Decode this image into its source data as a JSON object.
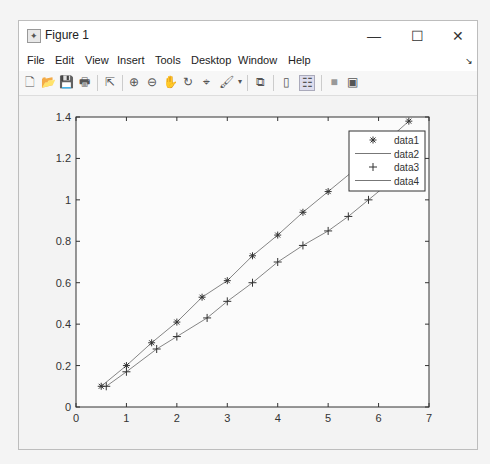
{
  "window": {
    "title": "Figure 1",
    "controls": {
      "minimize": "—",
      "maximize": "☐",
      "close": "✕"
    }
  },
  "menu": [
    "File",
    "Edit",
    "View",
    "Insert",
    "Tools",
    "Desktop",
    "Window",
    "Help"
  ],
  "toolbar": [
    {
      "name": "new-figure-icon",
      "glyph": "🗋"
    },
    {
      "name": "open-file-icon",
      "glyph": "📂"
    },
    {
      "name": "save-icon",
      "glyph": "💾"
    },
    {
      "name": "print-icon",
      "glyph": "🖶"
    },
    {
      "name": "edit-plot-icon",
      "glyph": "⇱"
    },
    {
      "name": "zoom-in-icon",
      "glyph": "⊕"
    },
    {
      "name": "zoom-out-icon",
      "glyph": "⊖"
    },
    {
      "name": "pan-icon",
      "glyph": "✋"
    },
    {
      "name": "rotate-3d-icon",
      "glyph": "↻"
    },
    {
      "name": "data-cursor-icon",
      "glyph": "⌖"
    },
    {
      "name": "brush-icon",
      "glyph": "🖌"
    },
    {
      "name": "link-plot-icon",
      "glyph": "⧉"
    },
    {
      "name": "colorbar-icon",
      "glyph": "▯"
    },
    {
      "name": "legend-icon",
      "glyph": "☷"
    },
    {
      "name": "hide-plot-tools-icon",
      "glyph": "■"
    },
    {
      "name": "show-plot-tools-icon",
      "glyph": "▣"
    }
  ],
  "chart_data": {
    "type": "line",
    "title": "",
    "xlabel": "",
    "ylabel": "",
    "xlim": [
      0,
      7
    ],
    "ylim": [
      0,
      1.4
    ],
    "xticks": [
      "0",
      "1",
      "2",
      "3",
      "4",
      "5",
      "6",
      "7"
    ],
    "yticks": [
      "0",
      "0.2",
      "0.4",
      "0.6",
      "0.8",
      "1",
      "1.2",
      "1.4"
    ],
    "grid": false,
    "legend_position": "northeast",
    "legend": [
      "data1",
      "data2",
      "data3",
      "data4"
    ],
    "series": [
      {
        "name": "data1",
        "marker": "*",
        "line": "none",
        "x": [
          0.5,
          1.0,
          1.5,
          2.0,
          2.5,
          3.0,
          3.5,
          4.0,
          4.5,
          5.0,
          5.5,
          6.0,
          6.6
        ],
        "y": [
          0.1,
          0.2,
          0.31,
          0.41,
          0.53,
          0.61,
          0.73,
          0.83,
          0.94,
          1.04,
          1.14,
          1.25,
          1.38
        ]
      },
      {
        "name": "data2",
        "marker": "none",
        "line": "solid",
        "x": [
          0.5,
          1.0,
          1.5,
          2.0,
          2.5,
          3.0,
          3.5,
          4.0,
          4.5,
          5.0,
          5.5,
          6.0,
          6.6
        ],
        "y": [
          0.1,
          0.2,
          0.31,
          0.41,
          0.53,
          0.61,
          0.73,
          0.83,
          0.94,
          1.04,
          1.14,
          1.25,
          1.38
        ]
      },
      {
        "name": "data3",
        "marker": "+",
        "line": "none",
        "x": [
          0.6,
          1.0,
          1.6,
          2.0,
          2.6,
          3.0,
          3.5,
          4.0,
          4.5,
          5.0,
          5.4,
          5.8,
          6.2,
          6.6
        ],
        "y": [
          0.1,
          0.17,
          0.28,
          0.34,
          0.43,
          0.51,
          0.6,
          0.7,
          0.78,
          0.85,
          0.92,
          1.0,
          1.08,
          1.16
        ]
      },
      {
        "name": "data4",
        "marker": "none",
        "line": "solid",
        "x": [
          0.6,
          1.0,
          1.6,
          2.0,
          2.6,
          3.0,
          3.5,
          4.0,
          4.5,
          5.0,
          5.4,
          5.8,
          6.2,
          6.6
        ],
        "y": [
          0.1,
          0.17,
          0.28,
          0.34,
          0.43,
          0.51,
          0.6,
          0.7,
          0.78,
          0.85,
          0.92,
          1.0,
          1.08,
          1.16
        ]
      }
    ]
  }
}
